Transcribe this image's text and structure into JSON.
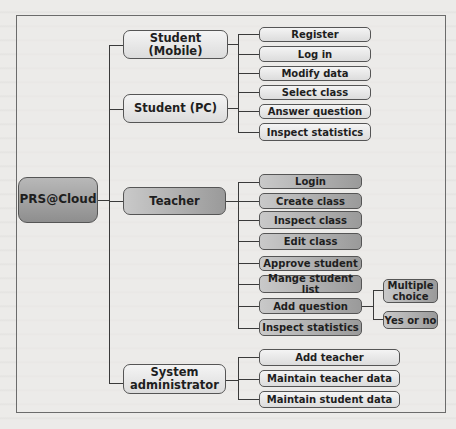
{
  "diagram": {
    "root": "PRS@Cloud",
    "branches": [
      {
        "label": "Student (Mobile)",
        "style": "light"
      },
      {
        "label": "Student (PC)",
        "style": "light"
      },
      {
        "label": "Teacher",
        "style": "dark"
      },
      {
        "label": "System administrator",
        "style": "light"
      }
    ],
    "student_functions": [
      "Register",
      "Log in",
      "Modify data",
      "Select class",
      "Answer question",
      "Inspect statistics"
    ],
    "teacher_functions": [
      "Login",
      "Create class",
      "Inspect class",
      "Edit class",
      "Approve student",
      "Mange student list",
      "Add question",
      "Inspect statistics"
    ],
    "question_types": [
      "Multiple choice",
      "Yes or no"
    ],
    "admin_functions": [
      "Add teacher",
      "Maintain teacher data",
      "Maintain student data"
    ]
  }
}
